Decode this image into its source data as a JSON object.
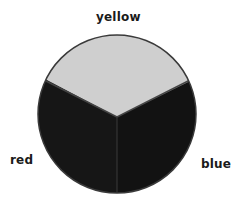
{
  "diagram": {
    "type": "color-wheel",
    "segments": [
      {
        "name": "yellow",
        "label": "yellow",
        "fill": "#cfcfcf"
      },
      {
        "name": "red",
        "label": "red",
        "fill": "#161616"
      },
      {
        "name": "blue",
        "label": "blue",
        "fill": "#131313"
      }
    ],
    "outline_color": "#3a3a3a"
  }
}
